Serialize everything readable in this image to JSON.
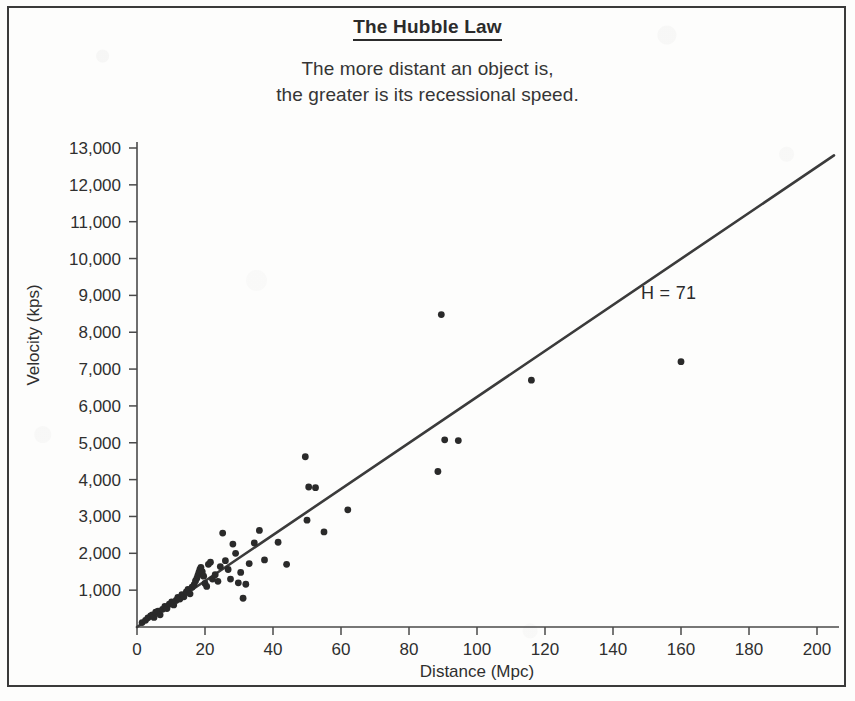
{
  "figure": {
    "title": "The Hubble Law",
    "subtitle_line_1": "The more distant an object is,",
    "subtitle_line_2": "the greater is its recessional speed.",
    "border_color": "#3a3a3a",
    "background_color": "#fdfdfc"
  },
  "chart_data": {
    "type": "scatter",
    "title": "The Hubble Law",
    "subtitle": "The more distant an object is, the greater is its recessional speed.",
    "xlabel": "Distance (Mpc)",
    "ylabel": "Velocity (kps)",
    "xlim": [
      0,
      206
    ],
    "ylim": [
      0,
      13600
    ],
    "xticks": [
      0,
      20,
      40,
      60,
      80,
      100,
      120,
      140,
      160,
      180,
      200
    ],
    "xtick_labels": [
      "0",
      "20",
      "40",
      "60",
      "80",
      "100",
      "120",
      "140",
      "160",
      "180",
      "200"
    ],
    "yticks": [
      1000,
      2000,
      3000,
      4000,
      5000,
      6000,
      7000,
      8000,
      9000,
      10000,
      11000,
      12000,
      13000
    ],
    "ytick_labels": [
      "1,000",
      "2,000",
      "3,000",
      "4,000",
      "5,000",
      "6,000",
      "7,000",
      "8,000",
      "9,000",
      "10,000",
      "11,000",
      "12,000",
      "13,000"
    ],
    "grid": false,
    "legend": null,
    "point_color": "#2a2a2a",
    "point_radius": 3.4,
    "annotations": [
      {
        "text": "H = 71",
        "x": 160,
        "y": 9000,
        "name": "hubble-constant-annotation"
      }
    ],
    "series": [
      {
        "name": "Galaxies",
        "type": "scatter",
        "points": [
          [
            1.5,
            120
          ],
          [
            2.5,
            180
          ],
          [
            3.2,
            250
          ],
          [
            4.0,
            300
          ],
          [
            4.5,
            330
          ],
          [
            5.0,
            260
          ],
          [
            5.5,
            400
          ],
          [
            6.2,
            430
          ],
          [
            6.8,
            330
          ],
          [
            7.5,
            480
          ],
          [
            8.2,
            560
          ],
          [
            8.8,
            500
          ],
          [
            9.5,
            620
          ],
          [
            10.2,
            680
          ],
          [
            10.8,
            600
          ],
          [
            11.5,
            720
          ],
          [
            12.0,
            800
          ],
          [
            12.6,
            760
          ],
          [
            13.2,
            880
          ],
          [
            13.8,
            820
          ],
          [
            14.5,
            950
          ],
          [
            15.0,
            1020
          ],
          [
            15.6,
            900
          ],
          [
            16.2,
            1080
          ],
          [
            16.8,
            1150
          ],
          [
            17.2,
            1250
          ],
          [
            17.6,
            1320
          ],
          [
            17.9,
            1400
          ],
          [
            18.2,
            1480
          ],
          [
            18.5,
            1560
          ],
          [
            18.8,
            1620
          ],
          [
            19.2,
            1500
          ],
          [
            19.6,
            1380
          ],
          [
            20.0,
            1180
          ],
          [
            20.5,
            1100
          ],
          [
            21.0,
            1700
          ],
          [
            21.6,
            1760
          ],
          [
            22.2,
            1300
          ],
          [
            23.0,
            1420
          ],
          [
            23.8,
            1240
          ],
          [
            24.5,
            1640
          ],
          [
            25.2,
            2550
          ],
          [
            26.0,
            1800
          ],
          [
            26.8,
            1560
          ],
          [
            27.5,
            1300
          ],
          [
            28.2,
            2250
          ],
          [
            29.0,
            2000
          ],
          [
            29.8,
            1200
          ],
          [
            30.5,
            1480
          ],
          [
            31.2,
            780
          ],
          [
            32.0,
            1160
          ],
          [
            33.0,
            1720
          ],
          [
            34.5,
            2280
          ],
          [
            36.0,
            2620
          ],
          [
            37.5,
            1820
          ],
          [
            41.5,
            2300
          ],
          [
            44.0,
            1700
          ],
          [
            49.5,
            4620
          ],
          [
            50.5,
            3800
          ],
          [
            52.5,
            3780
          ],
          [
            50.0,
            2900
          ],
          [
            55.0,
            2580
          ],
          [
            62.0,
            3180
          ],
          [
            88.5,
            4220
          ],
          [
            89.5,
            8480
          ],
          [
            90.5,
            5080
          ],
          [
            94.5,
            5060
          ],
          [
            116.0,
            6700
          ],
          [
            160.0,
            7200
          ]
        ]
      },
      {
        "name": "Hubble fit line",
        "type": "line",
        "slope": 71,
        "intercept": 0,
        "x_start": 0,
        "x_end": 205,
        "y_start": 0,
        "y_end": 12800
      }
    ]
  },
  "axes": {
    "x_title": "Distance (Mpc)",
    "y_title": "Velocity (kps)"
  }
}
